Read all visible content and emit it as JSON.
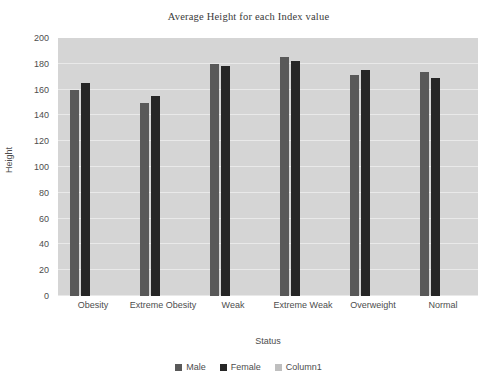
{
  "chart_data": {
    "type": "bar",
    "title": "Average Height for each Index value",
    "xlabel": "Status",
    "ylabel": "Height",
    "categories": [
      "Obesity",
      "Extreme Obesity",
      "Weak",
      "Extreme Weak",
      "Overweight",
      "Normal"
    ],
    "series": [
      {
        "name": "Male",
        "color": "#595959",
        "values": [
          160,
          150,
          180,
          185,
          171,
          174
        ]
      },
      {
        "name": "Female",
        "color": "#262626",
        "values": [
          165,
          155,
          178,
          182,
          175,
          169
        ]
      },
      {
        "name": "Column1",
        "color": "#bfbfbf",
        "values": [
          0,
          0,
          0,
          0,
          0,
          0
        ]
      }
    ],
    "ylim": [
      0,
      200
    ],
    "ytick_step": 20,
    "yticks": [
      0,
      20,
      40,
      60,
      80,
      100,
      120,
      140,
      160,
      180,
      200
    ],
    "grid": true,
    "legend_position": "bottom",
    "plot_background": "#d5d5d5",
    "gridline_color": "#e9e9e9"
  }
}
